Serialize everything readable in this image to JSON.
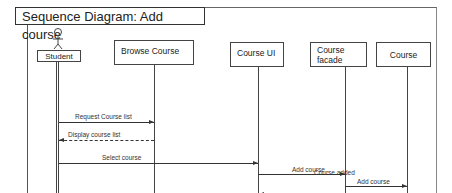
{
  "diagram": {
    "title": "Sequence Diagram: Add course",
    "participants": [
      {
        "id": "student",
        "label": "Student",
        "type": "actor"
      },
      {
        "id": "browse",
        "label": "Browse Course",
        "type": "object"
      },
      {
        "id": "courseui",
        "label": "Course UI",
        "type": "object"
      },
      {
        "id": "facade_line1",
        "label": "Course",
        "type": "object"
      },
      {
        "id": "facade_line2",
        "label": "facade",
        "type": "object"
      },
      {
        "id": "course",
        "label": "Course",
        "type": "object"
      }
    ],
    "messages": [
      {
        "label": "Request  Course  list",
        "from": "Student",
        "to": "Browse Course",
        "style": "solid"
      },
      {
        "label": "Display course list",
        "from": "Browse Course",
        "to": "Student",
        "style": "dashed"
      },
      {
        "label": "Select course",
        "from": "Student",
        "to": "Course UI",
        "style": "solid"
      },
      {
        "label": "Add course",
        "from": "Course UI",
        "to": "Course facade",
        "style": "solid"
      },
      {
        "label": "Add course",
        "from": "Course facade",
        "to": "Course",
        "style": "solid"
      },
      {
        "label": "Course added",
        "from": "Course",
        "to": "Course UI",
        "style": "dashed"
      }
    ]
  }
}
